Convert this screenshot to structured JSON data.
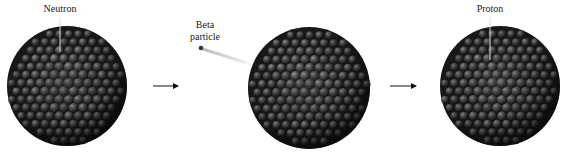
{
  "diagram": {
    "labels": {
      "neutron": "Neutron",
      "beta_line1": "Beta",
      "beta_line2": "particle",
      "proton": "Proton"
    },
    "nuclei": [
      {
        "name": "initial-nucleus",
        "cx": 67,
        "cy": 86,
        "r": 60
      },
      {
        "name": "decaying-nucleus",
        "cx": 309,
        "cy": 88,
        "r": 61
      },
      {
        "name": "final-nucleus",
        "cx": 500,
        "cy": 86,
        "r": 60
      }
    ],
    "arrows": [
      {
        "x1": 153,
        "x2": 182,
        "y": 86
      },
      {
        "x1": 390,
        "x2": 420,
        "y": 86
      }
    ],
    "colors": {
      "nucleon_dark": "#1e1e1e",
      "nucleon_mid": "#4a4a4a",
      "nucleon_light": "#8a8a8a",
      "text": "#222222",
      "trail": "#cfcfcf"
    }
  }
}
